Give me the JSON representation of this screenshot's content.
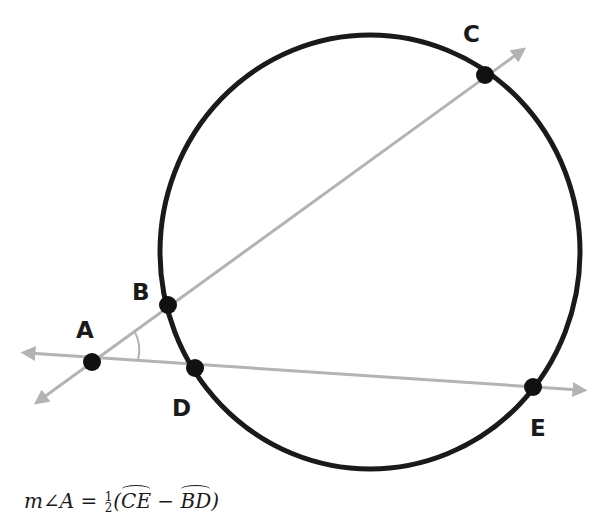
{
  "diagram": {
    "type": "geometry",
    "colors": {
      "circle": "#1a1a1a",
      "lines": "#b3b3b3",
      "points": "#111111",
      "labels": "#1a1a1a"
    },
    "circle": {
      "cx": 370,
      "cy": 252,
      "rx": 210,
      "ry": 217
    },
    "points": [
      {
        "id": "A",
        "label": "A",
        "x": 92,
        "y": 362,
        "label_x": 76,
        "label_y": 338
      },
      {
        "id": "B",
        "label": "B",
        "x": 168,
        "y": 305,
        "label_x": 132,
        "label_y": 300
      },
      {
        "id": "C",
        "label": "C",
        "x": 485,
        "y": 75,
        "label_x": 463,
        "label_y": 42
      },
      {
        "id": "D",
        "label": "D",
        "x": 195,
        "y": 368,
        "label_x": 172,
        "label_y": 416
      },
      {
        "id": "E",
        "label": "E",
        "x": 533,
        "y": 387,
        "label_x": 530,
        "label_y": 436
      }
    ],
    "secants": [
      {
        "name": "ray-ABC",
        "from": [
          40,
          400
        ],
        "to": [
          520,
          52
        ]
      },
      {
        "name": "ray-ADE",
        "from": [
          28,
          353
        ],
        "to": [
          580,
          390
        ]
      }
    ],
    "formula": {
      "lhs": "m∠A = ",
      "frac_num": "1",
      "frac_den": "2",
      "open": "(",
      "arc1": "CE",
      "minus": " − ",
      "arc2": "BD",
      "close": ")"
    }
  }
}
